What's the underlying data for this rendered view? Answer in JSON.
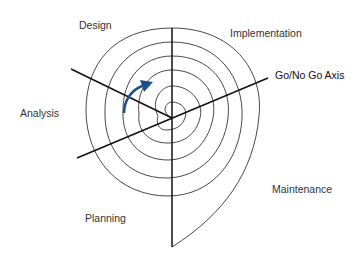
{
  "diagram": {
    "type": "spiral-model",
    "labels": {
      "design": "Design",
      "implementation": "Implementation",
      "go_no_go": "Go/No Go Axis",
      "analysis": "Analysis",
      "planning": "Planning",
      "maintenance": "Maintenance"
    },
    "arrow_color": "#1f4e8c",
    "line_color": "#222222"
  }
}
